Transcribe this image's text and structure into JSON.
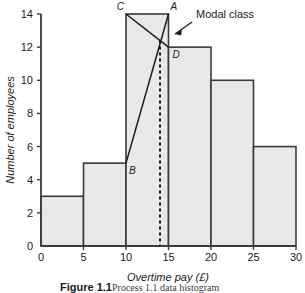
{
  "figure": {
    "caption_bold": "Figure 1.1",
    "caption_rest": "Process 1.1 data histogram"
  },
  "colors": {
    "bar_fill": "#e8e8e8",
    "bar_stroke": "#3a3a3a",
    "axis": "#3a3a3a",
    "text": "#1a1a1a",
    "construction_line": "#1a1a1a",
    "modal_dashed": "#1a1a1a"
  },
  "annotations": {
    "modal_class_label": "Modal class",
    "point_A": "A",
    "point_B": "B",
    "point_C": "C",
    "point_D": "D"
  },
  "chart_data": {
    "type": "bar",
    "title": "",
    "subtitle": "",
    "xlabel": "Overtime pay (£)",
    "ylabel": "Number of employees",
    "xlim": [
      0,
      30
    ],
    "ylim": [
      0,
      14
    ],
    "grid": false,
    "legend": null,
    "xticks": [
      0,
      5,
      10,
      15,
      20,
      25,
      30
    ],
    "xtick_labels": [
      "0",
      "5",
      "10",
      "15",
      "20",
      "25",
      "30"
    ],
    "yticks": [
      0,
      2,
      4,
      6,
      8,
      10,
      12,
      14
    ],
    "ytick_labels": [
      "0",
      "2",
      "4",
      "6",
      "8",
      "10",
      "12",
      "14"
    ],
    "bin_edges": [
      0,
      5,
      10,
      15,
      20,
      25,
      30
    ],
    "categories": [
      "0-5",
      "5-10",
      "10-15",
      "15-20",
      "20-25",
      "25-30"
    ],
    "values": [
      3,
      5,
      14,
      12,
      10,
      6
    ],
    "modal_class": "10-15",
    "mode_estimate": 14,
    "construction": {
      "line_C_to_D": [
        [
          10,
          14
        ],
        [
          15,
          12
        ]
      ],
      "line_A_to_B": [
        [
          15,
          14
        ],
        [
          10,
          5
        ]
      ],
      "intersection": [
        14,
        12.4
      ],
      "dashed_vertical_x": 14
    },
    "points": [
      {
        "name": "A",
        "x": 15,
        "y": 14
      },
      {
        "name": "B",
        "x": 10,
        "y": 5
      },
      {
        "name": "C",
        "x": 10,
        "y": 14
      },
      {
        "name": "D",
        "x": 15,
        "y": 12
      }
    ]
  }
}
